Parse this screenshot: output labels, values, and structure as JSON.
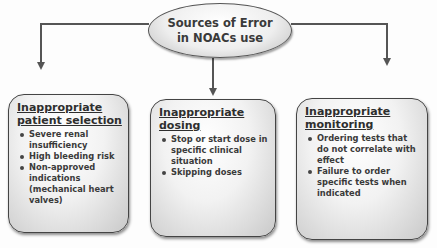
{
  "diagram": {
    "root": {
      "line1": "Sources of Error",
      "line2": "in NOACs use"
    },
    "boxes": [
      {
        "title_line1": "Inappropriate",
        "title_line2": "patient selection",
        "items": [
          "Severe renal insufficiency",
          "High bleeding risk",
          "Non-approved indications (mechanical heart valves)"
        ]
      },
      {
        "title_line1": "Inappropriate",
        "title_line2": "dosing",
        "items": [
          "Stop or start dose in specific clinical situation",
          "Skipping doses"
        ]
      },
      {
        "title_line1": "Inappropriate",
        "title_line2": "monitoring",
        "items": [
          "Ordering tests that do not correlate with effect",
          "Failure to order specific tests when indicated"
        ]
      }
    ],
    "colors": {
      "line": "#555555",
      "text": "#333333",
      "background": "#fdfdfd"
    }
  }
}
